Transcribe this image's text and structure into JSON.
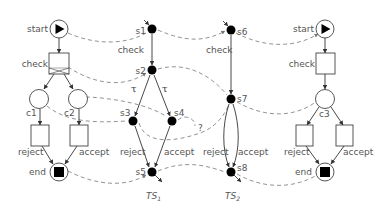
{
  "diagram": {
    "type": "petri-net-to-transition-system-mapping",
    "left_net": {
      "places": [
        {
          "id": "start",
          "label": "start",
          "token": "play-triangle"
        },
        {
          "id": "c1",
          "label": "c1"
        },
        {
          "id": "c2",
          "label": "c2"
        },
        {
          "id": "end",
          "label": "end",
          "token": "filled-square"
        }
      ],
      "transitions": [
        {
          "id": "check",
          "label": "check",
          "style": "crossed"
        },
        {
          "id": "reject",
          "label": "reject"
        },
        {
          "id": "accept",
          "label": "accept"
        }
      ]
    },
    "ts1": {
      "title": "TS",
      "subscript": "1",
      "states": [
        "s1",
        "s2",
        "s3",
        "s4",
        "s5"
      ],
      "edges": [
        {
          "from": "s1",
          "to": "s2",
          "label": "check"
        },
        {
          "from": "s2",
          "to": "s3",
          "label": "τ"
        },
        {
          "from": "s2",
          "to": "s4",
          "label": "τ"
        },
        {
          "from": "s3",
          "to": "s5",
          "label": "reject"
        },
        {
          "from": "s4",
          "to": "s5",
          "label": "accept"
        }
      ]
    },
    "ts2": {
      "title": "TS",
      "subscript": "2",
      "states": [
        "s6",
        "s7",
        "s8"
      ],
      "edges": [
        {
          "from": "s6",
          "to": "s7",
          "label": "check"
        },
        {
          "from": "s7",
          "to": "s8",
          "label": "reject"
        },
        {
          "from": "s7",
          "to": "s8",
          "label": "accept"
        }
      ]
    },
    "right_net": {
      "places": [
        {
          "id": "start",
          "label": "start",
          "token": "play-triangle"
        },
        {
          "id": "c3",
          "label": "c3"
        },
        {
          "id": "end",
          "label": "end",
          "token": "filled-square"
        }
      ],
      "transitions": [
        {
          "id": "check",
          "label": "check"
        },
        {
          "id": "reject",
          "label": "reject"
        },
        {
          "id": "accept",
          "label": "accept"
        }
      ]
    },
    "question_mark": "?",
    "tau_symbol": "τ",
    "colors": {
      "line": "#333333",
      "dashed": "#777777",
      "text": "#555555",
      "fill_state": "#000000"
    }
  }
}
